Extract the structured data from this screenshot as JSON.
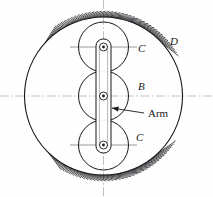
{
  "figure": {
    "type": "mechanical-engineering-line-diagram",
    "background_color": "#fefefe",
    "line_color": "#16181b",
    "centerline_color": "#b9b9b9"
  },
  "labels": {
    "ring_gear": "D",
    "gear_top": "C",
    "gear_center": "B",
    "gear_bottom": "C",
    "arm": "Arm"
  },
  "geometry": {
    "canvas": {
      "width": 213,
      "height": 197
    },
    "center": {
      "x": 103.5,
      "y": 96
    },
    "ring_gear": {
      "cx": 103.5,
      "cy": 96,
      "r": 79
    },
    "gears": [
      {
        "name": "gear_top",
        "label": "C",
        "cx": 103.5,
        "cy": 47,
        "r": 25
      },
      {
        "name": "gear_center",
        "label": "B",
        "cx": 103.5,
        "cy": 96,
        "r": 25
      },
      {
        "name": "gear_bottom",
        "label": "C",
        "cx": 103.5,
        "cy": 145,
        "r": 25
      }
    ],
    "arm": {
      "x_left": 96,
      "x_right": 111,
      "y_top": 39,
      "y_bottom": 153,
      "corner_radius": 7
    },
    "pivots": [
      {
        "cx": 103.5,
        "cy": 47,
        "r_outer": 4.0,
        "r_inner": 1.4
      },
      {
        "cx": 103.5,
        "cy": 96,
        "r_outer": 4.0,
        "r_inner": 1.4
      },
      {
        "cx": 103.5,
        "cy": 145,
        "r_outer": 4.0,
        "r_inner": 1.4
      }
    ],
    "hatching": {
      "top": {
        "arc_center_deg": 270,
        "half_span_deg": 48,
        "tick_count": 39,
        "tick_len": 6
      },
      "bottom": {
        "arc_center_deg": 90,
        "half_span_deg": 44,
        "tick_count": 37,
        "tick_len": 6
      }
    },
    "centerlines": {
      "horizontal": {
        "x1": 0,
        "x2": 213,
        "y": 96
      },
      "vertical": {
        "x": 103.5,
        "y1": 0,
        "y2": 197
      }
    },
    "gear_center_ticks": [
      {
        "y": 47,
        "x1": 70,
        "x2": 137
      },
      {
        "y": 145,
        "x1": 70,
        "x2": 137
      }
    ]
  },
  "label_positions": {
    "ring_gear": {
      "x": 170,
      "y": 45
    },
    "gear_top": {
      "x": 138,
      "y": 52
    },
    "gear_center": {
      "x": 138,
      "y": 90
    },
    "gear_bottom": {
      "x": 136,
      "y": 141
    },
    "arm": {
      "x": 148,
      "y": 117
    }
  },
  "leader": {
    "name": "arm-leader-line",
    "from": {
      "x": 144,
      "y": 113
    },
    "to": {
      "x": 112,
      "y": 108
    },
    "arrow": "left"
  }
}
